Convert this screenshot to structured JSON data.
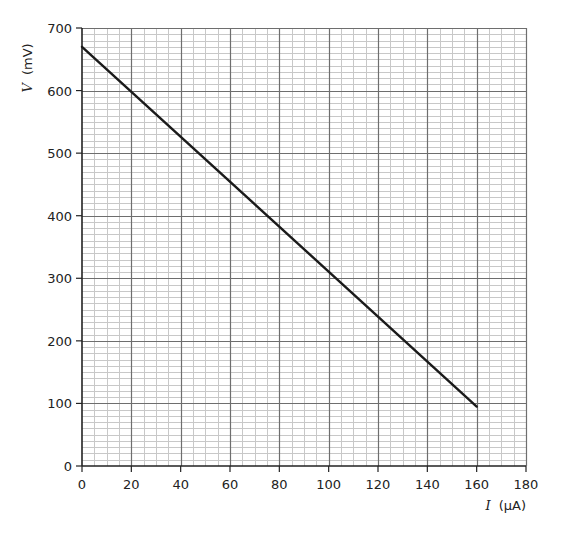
{
  "chart_data": {
    "type": "line",
    "title": "",
    "xlabel_var": "I",
    "xlabel_unit": "(µA)",
    "ylabel_var": "V",
    "ylabel_unit": "(mV)",
    "xlim": [
      0,
      180
    ],
    "ylim": [
      0,
      700
    ],
    "x_major_step": 20,
    "x_minor_step": 5,
    "y_major_step": 100,
    "y_minor_step": 10,
    "grid": true,
    "x_ticks": [
      "0",
      "20",
      "40",
      "60",
      "80",
      "100",
      "120",
      "140",
      "160",
      "180"
    ],
    "y_ticks": [
      "0",
      "100",
      "200",
      "300",
      "400",
      "500",
      "600",
      "700"
    ],
    "series": [
      {
        "name": "V vs I",
        "x": [
          0,
          160
        ],
        "y": [
          670,
          95
        ]
      }
    ],
    "colors": {
      "minor_grid": "#c8c8c8",
      "major_grid": "#6e6e6e",
      "axis": "#222222",
      "line": "#1a1a1a"
    }
  }
}
